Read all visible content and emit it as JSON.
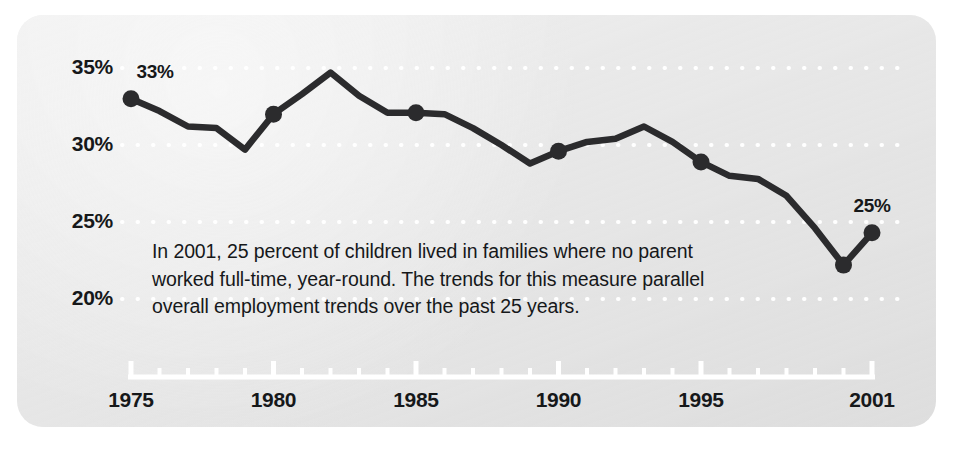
{
  "chart_data": {
    "type": "line",
    "title": "",
    "subtitle": "",
    "xlabel": "",
    "ylabel": "",
    "xlim": [
      1975,
      2001
    ],
    "ylim": [
      18.5,
      36.0
    ],
    "grid": "horizontal-dotted-white",
    "legend": "none",
    "line_color": "#2b2b2d",
    "marker_color": "#2b2b2d",
    "background_color": "#e8e8e8",
    "page_background": "#ffffff",
    "gridline_color": "#ffffff",
    "axis_color": "#ffffff",
    "text_color": "#16181a",
    "y_ticks": [
      "35%",
      "30%",
      "25%",
      "20%"
    ],
    "y_tick_values": [
      35,
      30,
      25,
      20
    ],
    "x_ticks": [
      "1975",
      "1980",
      "1985",
      "1990",
      "1995",
      "2001"
    ],
    "x_tick_values": [
      1975,
      1980,
      1985,
      1990,
      1995,
      2001
    ],
    "x": [
      1975,
      1976,
      1977,
      1978,
      1979,
      1980,
      1981,
      1982,
      1983,
      1984,
      1985,
      1986,
      1987,
      1988,
      1989,
      1990,
      1991,
      1992,
      1993,
      1994,
      1995,
      1996,
      1997,
      1998,
      1999,
      2000,
      2001
    ],
    "values": [
      33.0,
      32.2,
      31.2,
      31.1,
      29.7,
      32.0,
      33.3,
      34.7,
      33.2,
      32.1,
      32.1,
      32.0,
      31.1,
      30.0,
      28.8,
      29.6,
      30.2,
      30.4,
      31.2,
      30.2,
      28.9,
      28.0,
      27.8,
      26.7,
      24.6,
      22.2,
      24.3
    ],
    "annotations": [
      {
        "name": "first-point-label",
        "x": 1975,
        "y": 33.0,
        "text": "33%"
      },
      {
        "name": "last-point-label",
        "x": 2001,
        "y": 24.3,
        "text": "25%"
      }
    ],
    "markers": [
      {
        "x": 1975,
        "y": 33.0
      },
      {
        "x": 1980,
        "y": 32.0
      },
      {
        "x": 1985,
        "y": 32.1
      },
      {
        "x": 1990,
        "y": 29.6
      },
      {
        "x": 1995,
        "y": 28.9
      },
      {
        "x": 2000,
        "y": 22.2
      },
      {
        "x": 2001,
        "y": 24.3
      }
    ],
    "note": "In 2001, 25 percent of children lived in families where no parent worked full-time, year-round. The trends for this measure parallel overall employment trends over the past 25 years."
  },
  "axes": {
    "y_labels": [
      "35%",
      "30%",
      "25%",
      "20%"
    ],
    "x_labels": [
      "1975",
      "1980",
      "1985",
      "1990",
      "1995",
      "2001"
    ]
  },
  "labels": {
    "first_point": "33%",
    "last_point": "25%"
  },
  "annotation": {
    "text": "In 2001, 25 percent of children lived in families where no parent worked full-time, year-round. The trends for this measure parallel overall employment trends over the past 25 years."
  }
}
